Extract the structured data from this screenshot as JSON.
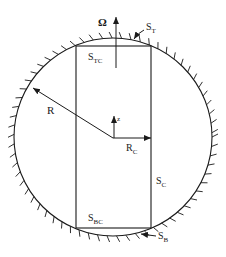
{
  "diagram": {
    "type": "geometry-schematic",
    "colors": {
      "stroke": "#1a1a1a",
      "background": "#ffffff"
    },
    "labels": {
      "omega": "Ω",
      "top_surface": "S",
      "top_surface_sub": "T",
      "top_cylinder_surface": "S",
      "top_cylinder_surface_sub": "TC",
      "radius": "R",
      "cylinder_radius": "R",
      "cylinder_radius_sub": "C",
      "z_axis": "z",
      "cylinder_side_surface": "S",
      "cylinder_side_surface_sub": "C",
      "bottom_cylinder_surface": "S",
      "bottom_cylinder_surface_sub": "BC",
      "bottom_surface": "S",
      "bottom_surface_sub": "B"
    }
  }
}
